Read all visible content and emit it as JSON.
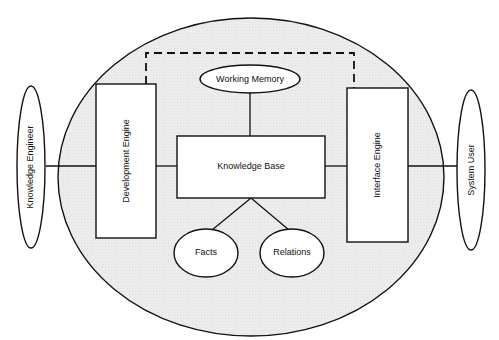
{
  "diagram": {
    "type": "expert-system-architecture",
    "colors": {
      "system_fill": "#ececec",
      "box_fill": "#ffffff",
      "stroke": "#111111",
      "background": "#ffffff"
    },
    "nodes": {
      "knowledge_engineer": {
        "label": "Knowledge Engineer",
        "shape": "ellipse",
        "orientation": "vertical"
      },
      "system_user": {
        "label": "System User",
        "shape": "ellipse",
        "orientation": "vertical"
      },
      "development_engine": {
        "label": "Development Engine",
        "shape": "rectangle",
        "orientation": "vertical"
      },
      "interface_engine": {
        "label": "Interface Engine",
        "shape": "rectangle",
        "orientation": "vertical"
      },
      "knowledge_base": {
        "label": "Knowledge Base",
        "shape": "rectangle"
      },
      "working_memory": {
        "label": "Working Memory",
        "shape": "ellipse"
      },
      "facts": {
        "label": "Facts",
        "shape": "ellipse"
      },
      "relations": {
        "label": "Relations",
        "shape": "ellipse"
      }
    },
    "edges": [
      {
        "from": "knowledge_engineer",
        "to": "development_engine",
        "style": "solid"
      },
      {
        "from": "development_engine",
        "to": "knowledge_base",
        "style": "solid"
      },
      {
        "from": "knowledge_base",
        "to": "interface_engine",
        "style": "solid"
      },
      {
        "from": "interface_engine",
        "to": "system_user",
        "style": "solid"
      },
      {
        "from": "working_memory",
        "to": "knowledge_base",
        "style": "solid"
      },
      {
        "from": "knowledge_base",
        "to": "facts",
        "style": "solid"
      },
      {
        "from": "knowledge_base",
        "to": "relations",
        "style": "solid"
      },
      {
        "from": "development_engine",
        "to": "interface_engine",
        "style": "dashed"
      }
    ]
  }
}
